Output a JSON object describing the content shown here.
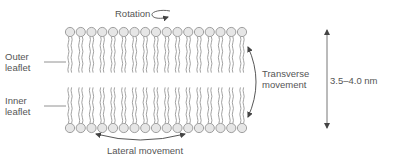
{
  "diagram": {
    "labels": {
      "rotation": "Rotation",
      "outer_leaflet_line1": "Outer",
      "outer_leaflet_line2": "leaflet",
      "inner_leaflet_line1": "Inner",
      "inner_leaflet_line2": "leaflet",
      "transverse_line1": "Transverse",
      "transverse_line2": "movement",
      "lateral": "Lateral movement",
      "thickness": "3.5–4.0 nm"
    },
    "bilayer": {
      "lipid_count_per_leaflet": 17,
      "head_color": "#e6e6e6",
      "stroke_color": "#8a8a8a"
    },
    "colors": {
      "text": "#555555",
      "arrow": "#444444",
      "background": "#ffffff"
    }
  }
}
